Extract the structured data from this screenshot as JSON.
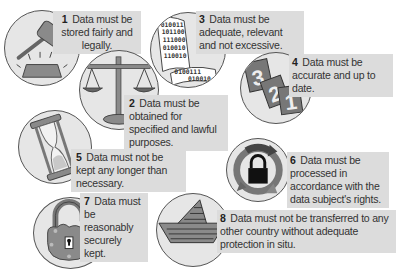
{
  "principles": [
    {
      "number": "1",
      "text": "Data must be stored fairly and legally.",
      "icon": "gavel-icon"
    },
    {
      "number": "2",
      "text": "Data must be obtained for specified and lawful purposes.",
      "icon": "scales-icon"
    },
    {
      "number": "3",
      "text": "Data must be adequate, relevant and not excessive.",
      "icon": "binary-scroll-icon"
    },
    {
      "number": "4",
      "text": "Data must be accurate and up to date.",
      "icon": "calendar-pages-icon"
    },
    {
      "number": "5",
      "text": "Data must not be kept any longer than necessary.",
      "icon": "hourglass-icon"
    },
    {
      "number": "6",
      "text": "Data must be processed in accordance with the data subject's rights.",
      "icon": "lock-cycle-icon"
    },
    {
      "number": "7",
      "text": "Data must be reasonably securely kept.",
      "icon": "padlock-icon"
    },
    {
      "number": "8",
      "text": "Data must not be transferred to any other country without adequate protection in situ.",
      "icon": "paper-boat-icon"
    }
  ],
  "binary_scroll_lines": [
    "010011",
    "101100",
    "111000",
    "010010",
    "110010",
    "0100111",
    "010010"
  ],
  "calendar_digits": [
    "3",
    "2",
    "1"
  ],
  "colors": {
    "circle_fill": "#e6e6e6",
    "label_bg": "#dcdcdc",
    "icon_fill": "#8a8a8a",
    "icon_dark": "#555555",
    "text": "#333333"
  }
}
